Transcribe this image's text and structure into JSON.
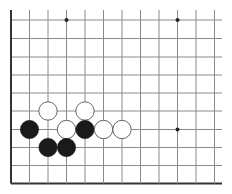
{
  "board": {
    "description": "Go board diagram (lower-left corner region)",
    "background": "#ffffff",
    "line_color": "#8a8a8a",
    "edge_color": "#333333",
    "columns_x": [
      11,
      29.5,
      48,
      66.5,
      85,
      103.5,
      122,
      140.5,
      159,
      177.5,
      196,
      214.5
    ],
    "rows_y": [
      20,
      38.5,
      57,
      75,
      93,
      111,
      129.5,
      147.5,
      165.5,
      183.5
    ],
    "top_extent": 10,
    "right_extent": 222,
    "edges": [
      "left",
      "bottom"
    ],
    "star_points": [
      {
        "col": 3,
        "row": 0
      },
      {
        "col": 9,
        "row": 0
      },
      {
        "col": 9,
        "row": 6
      }
    ],
    "stones": [
      {
        "color": "white",
        "col": 2,
        "row": 5
      },
      {
        "color": "white",
        "col": 4,
        "row": 5
      },
      {
        "color": "black",
        "col": 1,
        "row": 6
      },
      {
        "color": "white",
        "col": 3,
        "row": 6
      },
      {
        "color": "black",
        "col": 4,
        "row": 6
      },
      {
        "color": "white",
        "col": 5,
        "row": 6
      },
      {
        "color": "white",
        "col": 6,
        "row": 6
      },
      {
        "color": "black",
        "col": 2,
        "row": 7
      },
      {
        "color": "black",
        "col": 3,
        "row": 7
      }
    ],
    "stone_radius": 9.2,
    "colors": {
      "black_stone": "#1a1a1a",
      "white_stone": "#ffffff",
      "white_stone_outline": "#555555"
    }
  }
}
